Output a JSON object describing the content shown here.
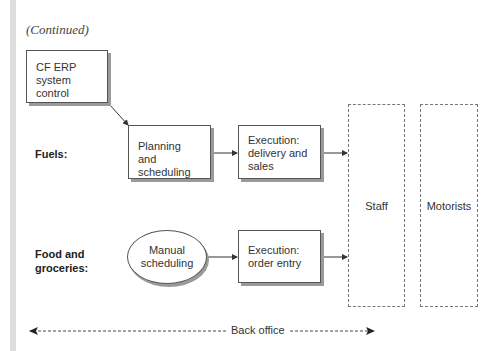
{
  "header": {
    "continued": "(Continued)"
  },
  "rows": [
    {
      "label_line1": "Fuels:",
      "label_line2": ""
    },
    {
      "label_line1": "Food and",
      "label_line2": "groceries:"
    }
  ],
  "nodes": {
    "erp": {
      "line1": "CF ERP",
      "line2": "system control"
    },
    "planning": {
      "line1": "Planning and",
      "line2": "scheduling"
    },
    "exec_delivery": {
      "line1": "Execution:",
      "line2": "delivery and",
      "line3": "sales"
    },
    "manual": {
      "line1": "Manual",
      "line2": "scheduling"
    },
    "exec_order": {
      "line1": "Execution:",
      "line2": "order entry"
    },
    "staff": "Staff",
    "motorists": "Motorists"
  },
  "footer": {
    "back_office": "Back office"
  }
}
